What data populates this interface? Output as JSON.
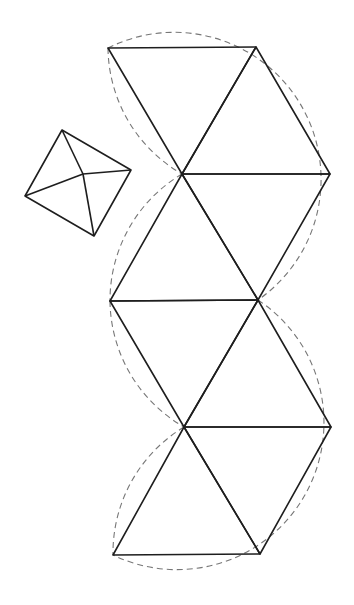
{
  "diagram": {
    "type": "geometric-net",
    "colors": {
      "line": "#1e1e1e",
      "dashed": "#777777",
      "background": "#ffffff"
    },
    "vertices": {
      "A": [
        108,
        48
      ],
      "B": [
        256,
        47
      ],
      "C": [
        182,
        174
      ],
      "D": [
        330,
        174
      ],
      "E": [
        110,
        301
      ],
      "F": [
        258,
        300
      ],
      "G": [
        184,
        427
      ],
      "H": [
        331,
        427
      ],
      "I": [
        113,
        555
      ],
      "J": [
        260,
        554
      ]
    },
    "triangles": [
      [
        "A",
        "B",
        "C"
      ],
      [
        "B",
        "C",
        "D"
      ],
      [
        "C",
        "D",
        "F"
      ],
      [
        "C",
        "E",
        "F"
      ],
      [
        "E",
        "F",
        "G"
      ],
      [
        "F",
        "G",
        "H"
      ],
      [
        "G",
        "H",
        "J"
      ],
      [
        "G",
        "I",
        "J"
      ]
    ],
    "dashed_arcs": [
      {
        "from": "A",
        "to": "F",
        "center": "C",
        "radius": 147,
        "through": [
          "B",
          "D"
        ]
      },
      {
        "from": "A",
        "to": "C",
        "center": "B",
        "radius": 147
      },
      {
        "from": "C",
        "to": "E",
        "center": "F",
        "radius": 147
      },
      {
        "from": "E",
        "to": "G",
        "center": "H",
        "radius": 147
      },
      {
        "from": "G",
        "to": "I",
        "center": "J",
        "radius": 147
      },
      {
        "from": "F",
        "to": "I",
        "center": "G",
        "radius": 147,
        "through": [
          "H",
          "J"
        ]
      }
    ],
    "pyramid": {
      "base": [
        [
          62,
          130
        ],
        [
          131,
          170
        ],
        [
          94,
          236
        ],
        [
          25,
          196
        ]
      ],
      "apex": [
        83,
        174
      ]
    }
  }
}
